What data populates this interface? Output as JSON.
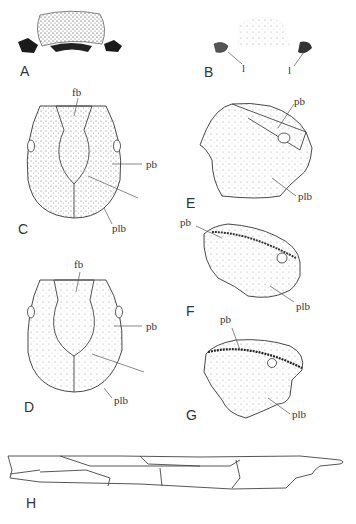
{
  "figure": {
    "panels": [
      {
        "id": "A",
        "label": "A",
        "annotations": []
      },
      {
        "id": "B",
        "label": "B",
        "annotations": [
          {
            "text": "l"
          },
          {
            "text": "l"
          }
        ]
      },
      {
        "id": "C",
        "label": "C",
        "annotations": [
          {
            "text": "fb"
          },
          {
            "text": "pb"
          },
          {
            "text": "plb"
          }
        ]
      },
      {
        "id": "D",
        "label": "D",
        "annotations": [
          {
            "text": "fb"
          },
          {
            "text": "pb"
          },
          {
            "text": "plb"
          }
        ]
      },
      {
        "id": "E",
        "label": "E",
        "annotations": [
          {
            "text": "pb"
          },
          {
            "text": "plb"
          }
        ]
      },
      {
        "id": "F",
        "label": "F",
        "annotations": [
          {
            "text": "pb"
          },
          {
            "text": "plb"
          }
        ]
      },
      {
        "id": "G",
        "label": "G",
        "annotations": [
          {
            "text": "pb"
          },
          {
            "text": "plb"
          }
        ]
      },
      {
        "id": "H",
        "label": "H",
        "annotations": []
      }
    ]
  }
}
